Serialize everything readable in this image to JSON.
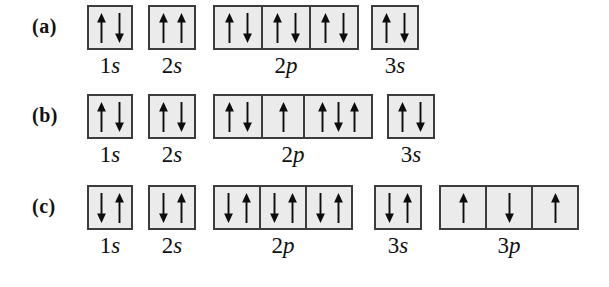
{
  "figure": {
    "type": "orbital-box-diagram",
    "colors": {
      "background": "#ffffff",
      "box_fill": "#ebebeb",
      "box_border": "#3c3c3c",
      "arrow": "#0d0d0d",
      "text": "#111111"
    },
    "rows": [
      {
        "label": "(a)",
        "top": 5,
        "label_x": 32,
        "groups": [
          {
            "num": "1",
            "letter": "s",
            "x": 87,
            "widths": [
              46
            ],
            "boxes": [
              [
                "up",
                "down"
              ]
            ]
          },
          {
            "num": "2",
            "letter": "s",
            "x": 148,
            "widths": [
              48
            ],
            "boxes": [
              [
                "up",
                "up"
              ]
            ]
          },
          {
            "num": "2",
            "letter": "p",
            "x": 213,
            "widths": [
              50,
              50,
              50
            ],
            "boxes": [
              [
                "up",
                "down"
              ],
              [
                "up",
                "down"
              ],
              [
                "up",
                "down"
              ]
            ]
          },
          {
            "num": "3",
            "letter": "s",
            "x": 371,
            "widths": [
              48
            ],
            "boxes": [
              [
                "up",
                "down"
              ]
            ]
          }
        ]
      },
      {
        "label": "(b)",
        "top": 94,
        "label_x": 32,
        "groups": [
          {
            "num": "1",
            "letter": "s",
            "x": 87,
            "widths": [
              46
            ],
            "boxes": [
              [
                "up",
                "down"
              ]
            ]
          },
          {
            "num": "2",
            "letter": "s",
            "x": 148,
            "widths": [
              48
            ],
            "boxes": [
              [
                "up",
                "down"
              ]
            ]
          },
          {
            "num": "2",
            "letter": "p",
            "x": 213,
            "widths": [
              50,
              44,
              70
            ],
            "boxes": [
              [
                "up",
                "down"
              ],
              [
                "up"
              ],
              [
                "up",
                "down",
                "up"
              ]
            ]
          },
          {
            "num": "3",
            "letter": "s",
            "x": 387,
            "widths": [
              48
            ],
            "boxes": [
              [
                "up",
                "down"
              ]
            ]
          }
        ]
      },
      {
        "label": "(c)",
        "top": 185,
        "label_x": 32,
        "groups": [
          {
            "num": "1",
            "letter": "s",
            "x": 87,
            "widths": [
              46
            ],
            "boxes": [
              [
                "down",
                "up"
              ]
            ]
          },
          {
            "num": "2",
            "letter": "s",
            "x": 148,
            "widths": [
              48
            ],
            "boxes": [
              [
                "down",
                "up"
              ]
            ]
          },
          {
            "num": "2",
            "letter": "p",
            "x": 213,
            "widths": [
              48,
              48,
              48
            ],
            "boxes": [
              [
                "down",
                "up"
              ],
              [
                "down",
                "up"
              ],
              [
                "down",
                "up"
              ]
            ]
          },
          {
            "num": "3",
            "letter": "s",
            "x": 374,
            "widths": [
              48
            ],
            "boxes": [
              [
                "down",
                "up"
              ]
            ]
          },
          {
            "num": "3",
            "letter": "p",
            "x": 439,
            "widths": [
              48,
              48,
              48
            ],
            "boxes": [
              [
                "up"
              ],
              [
                "down"
              ],
              [
                "up"
              ]
            ]
          }
        ]
      }
    ]
  }
}
